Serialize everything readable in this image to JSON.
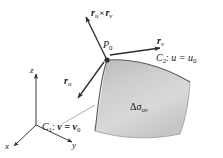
{
  "figure": {
    "name": "parametric-surface-patch-diagram",
    "background_color": "#ffffff",
    "ink_color": "#1a1a1a",
    "surface_fill": "#cfcfcf",
    "surface_edge": "#4a4a4a"
  },
  "labels": {
    "normal_vector": {
      "base": "r",
      "sub1": "u",
      "operator": "×",
      "base2": "r",
      "sub2": "v"
    },
    "point": {
      "base": "P",
      "sub": "0"
    },
    "tangent_v": {
      "base": "r",
      "sub": "v"
    },
    "tangent_u": {
      "base": "r",
      "sub": "u"
    },
    "curve_c2": {
      "name": "C",
      "num": "2",
      "sep": ":",
      "eq": "u = u",
      "eqsub": "0"
    },
    "curve_c1": {
      "name": "C",
      "num": "1",
      "sep": ":",
      "eq": "v = v",
      "eqsub": "0"
    },
    "patch_area": {
      "delta": "Δ",
      "sigma": "σ",
      "sub": "uv"
    }
  },
  "axes": {
    "z": "z",
    "y": "y",
    "x": "x"
  }
}
